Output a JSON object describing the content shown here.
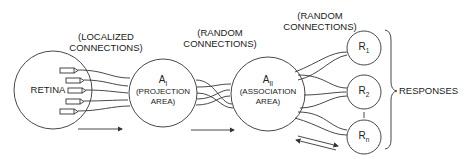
{
  "diagram": {
    "labels": {
      "localized_line1": "(LOCALIZED",
      "localized_line2": "CONNECTIONS)",
      "random1_line1": "(RANDOM",
      "random1_line2": "CONNECTIONS)",
      "random2_line1": "(RANDOM",
      "random2_line2": "CONNECTIONS)",
      "responses": "RESPONSES"
    },
    "nodes": {
      "retina": "RETINA",
      "a1": {
        "name": "A",
        "sub": "I",
        "desc1": "(PROJECTION",
        "desc2": "AREA)"
      },
      "a2": {
        "name": "A",
        "sub": "II",
        "desc1": "(ASSOCIATION",
        "desc2": "AREA)"
      },
      "r1": {
        "name": "R",
        "sub": "1"
      },
      "r2": {
        "name": "R",
        "sub": "2"
      },
      "rn": {
        "name": "R",
        "sub": "n"
      }
    },
    "colors": {
      "stroke": "#333333",
      "background": "#ffffff"
    }
  }
}
